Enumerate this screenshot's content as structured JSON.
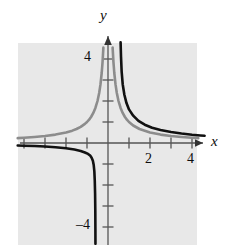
{
  "figure": {
    "kind": "cartesian-graph",
    "background_color": "#ffffff",
    "plot_background_color": "#e8e8e8"
  },
  "axes": {
    "x_axis_label": "x",
    "y_axis_label": "y",
    "axis_color": "#555555",
    "origin_px": {
      "x": 108,
      "y": 143
    },
    "unit_px": 21
  },
  "tick_labels": {
    "y_top": "4",
    "y_bottom": "–4",
    "x_two": "2",
    "x_four": "4"
  },
  "chart_data": {
    "type": "line",
    "title": "",
    "xlabel": "x",
    "ylabel": "y",
    "xlim": [
      -4.3,
      4.6
    ],
    "ylim": [
      -4.8,
      4.9
    ],
    "grid": false,
    "xticks": [
      -4,
      -3,
      -2,
      -1,
      1,
      2,
      3,
      4
    ],
    "yticks": [
      -4,
      -3,
      -2,
      -1,
      1,
      2,
      3,
      4
    ],
    "xtick_labels": [
      "",
      "",
      "",
      "",
      "",
      "2",
      "",
      "4"
    ],
    "ytick_labels": [
      "-4",
      "",
      "",
      "",
      "",
      "",
      "",
      "4"
    ],
    "series": [
      {
        "name": "gray-curve",
        "expression": "y = 1/x",
        "color": "#8c8c8c",
        "linewidth": 2.6,
        "vertical_asymptote": 0,
        "horizontal_asymptote": 0,
        "branches": [
          {
            "quadrant": "upper-left",
            "points": [
              [
                -4.3,
                -0.233
              ],
              [
                -4.0,
                -0.25
              ],
              [
                -3.5,
                -0.286
              ],
              [
                -3.0,
                -0.333
              ],
              [
                -2.5,
                -0.4
              ],
              [
                -2.0,
                -0.5
              ],
              [
                -1.7,
                -0.588
              ],
              [
                -1.5,
                -0.667
              ],
              [
                -1.3,
                -0.769
              ],
              [
                -1.1,
                -0.909
              ],
              [
                -1.0,
                -1.0
              ],
              [
                -0.9,
                -1.111
              ],
              [
                -0.8,
                -1.25
              ],
              [
                -0.7,
                -1.429
              ],
              [
                -0.6,
                -1.667
              ],
              [
                -0.5,
                -2.0
              ],
              [
                -0.42,
                -2.381
              ],
              [
                -0.36,
                -2.778
              ],
              [
                -0.3,
                -3.333
              ],
              [
                -0.26,
                -3.846
              ],
              [
                -0.22,
                -4.545
              ]
            ],
            "note": "drawn mirrored: rises to +4 as x approaches 0 from the left"
          },
          {
            "quadrant": "lower-right",
            "points": [
              [
                0.22,
                4.545
              ],
              [
                0.26,
                3.846
              ],
              [
                0.3,
                3.333
              ],
              [
                0.36,
                2.778
              ],
              [
                0.42,
                2.381
              ],
              [
                0.5,
                2.0
              ],
              [
                0.6,
                1.667
              ],
              [
                0.7,
                1.429
              ],
              [
                0.8,
                1.25
              ],
              [
                0.9,
                1.111
              ],
              [
                1.0,
                1.0
              ],
              [
                1.2,
                0.833
              ],
              [
                1.5,
                0.667
              ],
              [
                2.0,
                0.5
              ],
              [
                2.5,
                0.4
              ],
              [
                3.0,
                0.333
              ],
              [
                3.5,
                0.286
              ],
              [
                4.0,
                0.25
              ],
              [
                4.3,
                0.233
              ]
            ]
          }
        ]
      },
      {
        "name": "black-curve",
        "expression": "y = 1/(x - 0.5) shifted",
        "color": "#111111",
        "linewidth": 2.6,
        "vertical_asymptote": -0.12,
        "horizontal_asymptote": 0,
        "branches": [
          {
            "quadrant": "left-lower",
            "points": [
              [
                -4.3,
                -0.12
              ],
              [
                -4.0,
                -0.128
              ],
              [
                -3.5,
                -0.145
              ],
              [
                -3.0,
                -0.17
              ],
              [
                -2.5,
                -0.2
              ],
              [
                -2.0,
                -0.25
              ],
              [
                -1.6,
                -0.31
              ],
              [
                -1.3,
                -0.38
              ],
              [
                -1.1,
                -0.45
              ],
              [
                -0.95,
                -0.52
              ],
              [
                -0.85,
                -0.6
              ],
              [
                -0.78,
                -0.7
              ],
              [
                -0.72,
                -0.85
              ],
              [
                -0.68,
                -1.05
              ],
              [
                -0.65,
                -1.35
              ],
              [
                -0.63,
                -1.8
              ],
              [
                -0.615,
                -2.4
              ],
              [
                -0.605,
                -3.2
              ],
              [
                -0.6,
                -4.1
              ],
              [
                -0.597,
                -4.8
              ]
            ]
          },
          {
            "quadrant": "right-upper",
            "points": [
              [
                0.6,
                4.8
              ],
              [
                0.62,
                4.1
              ],
              [
                0.65,
                3.4
              ],
              [
                0.7,
                2.8
              ],
              [
                0.78,
                2.3
              ],
              [
                0.88,
                1.9
              ],
              [
                1.0,
                1.6
              ],
              [
                1.2,
                1.3
              ],
              [
                1.45,
                1.05
              ],
              [
                1.75,
                0.87
              ],
              [
                2.1,
                0.73
              ],
              [
                2.5,
                0.62
              ],
              [
                3.0,
                0.52
              ],
              [
                3.5,
                0.45
              ],
              [
                4.0,
                0.395
              ],
              [
                4.4,
                0.36
              ],
              [
                4.6,
                0.345
              ]
            ]
          }
        ]
      }
    ]
  }
}
